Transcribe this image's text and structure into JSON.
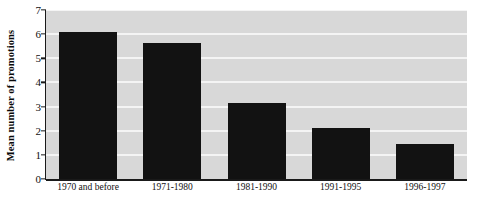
{
  "chart_data": {
    "type": "bar",
    "title": "",
    "xlabel": "",
    "ylabel": "Mean number of promotions",
    "categories": [
      "1970 and before",
      "1971-1980",
      "1981-1990",
      "1991-1995",
      "1996-1997"
    ],
    "values": [
      6.1,
      5.65,
      3.15,
      2.1,
      1.45
    ],
    "ylim": [
      0,
      7
    ],
    "ytick_labels": [
      "0",
      "1",
      "2",
      "3",
      "4",
      "5",
      "6",
      "7"
    ],
    "ytick_values": [
      0,
      1,
      2,
      3,
      4,
      5,
      6,
      7
    ],
    "grid": "horizontal",
    "legend": "none",
    "colors": {
      "bar": "#121212",
      "plot_background": "#d8d8d8",
      "gridline": "#f4f4f4",
      "axis": "#1a1a1a",
      "page_background": "#ffffff",
      "text": "#111111"
    }
  }
}
